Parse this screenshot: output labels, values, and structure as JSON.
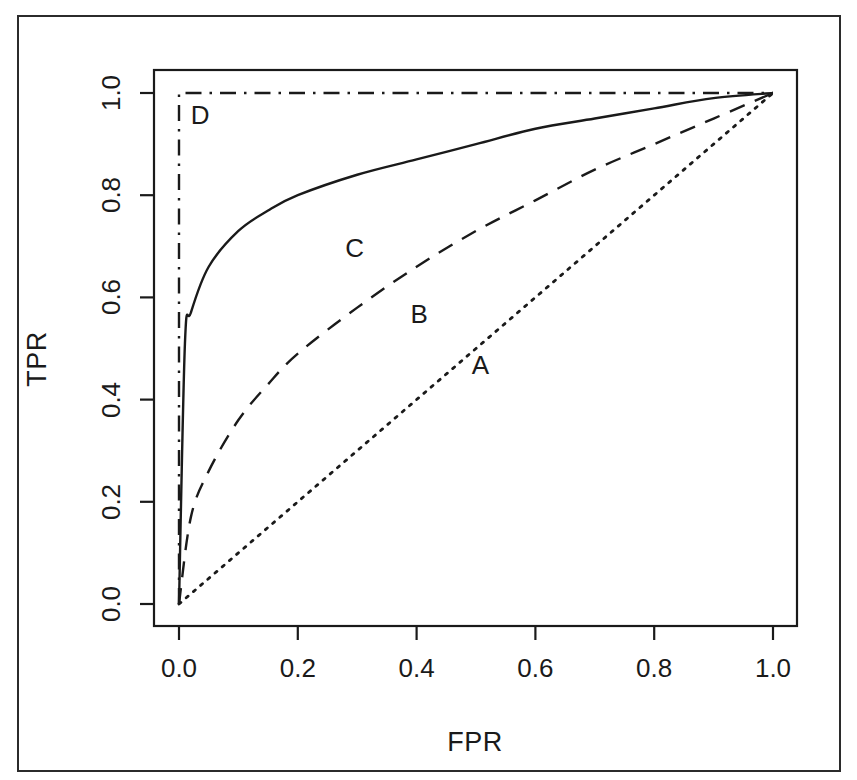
{
  "figure": {
    "plot_area": {
      "x0": 179,
      "x1": 773,
      "y0": 604,
      "y1": 93
    },
    "box": {
      "left": 154,
      "top": 70,
      "right": 797,
      "bottom": 626
    },
    "ink_color": "#1a1a1a"
  },
  "chart_data": {
    "type": "line",
    "title": "",
    "subtitle": "",
    "xlabel": "FPR",
    "ylabel": "TPR",
    "xlim": [
      0,
      1
    ],
    "ylim": [
      0,
      1
    ],
    "xticks": [
      0.0,
      0.2,
      0.4,
      0.6,
      0.8,
      1.0
    ],
    "yticks": [
      0.0,
      0.2,
      0.4,
      0.6,
      0.8,
      1.0
    ],
    "xticklabels": [
      "0.0",
      "0.2",
      "0.4",
      "0.6",
      "0.8",
      "1.0"
    ],
    "yticklabels": [
      "0.0",
      "0.2",
      "0.4",
      "0.6",
      "0.8",
      "1.0"
    ],
    "grid": false,
    "legend": "inline annotations on curves",
    "annotations": [
      {
        "text": "D",
        "x": 0.035,
        "y": 0.955
      },
      {
        "text": "C",
        "x": 0.295,
        "y": 0.695
      },
      {
        "text": "B",
        "x": 0.405,
        "y": 0.565
      },
      {
        "text": "A",
        "x": 0.508,
        "y": 0.465
      }
    ],
    "series": [
      {
        "name": "A",
        "label": "A",
        "linestyle": "dotted",
        "color": "#1a1a1a",
        "description": "random classifier, diagonal chance line",
        "x": [
          0.0,
          0.1,
          0.2,
          0.3,
          0.4,
          0.5,
          0.6,
          0.7,
          0.8,
          0.9,
          1.0
        ],
        "y": [
          0.0,
          0.1,
          0.2,
          0.3,
          0.4,
          0.5,
          0.6,
          0.7,
          0.8,
          0.9,
          1.0
        ]
      },
      {
        "name": "B",
        "label": "B",
        "linestyle": "dashed",
        "color": "#1a1a1a",
        "description": "moderate classifier",
        "x": [
          0.0,
          0.02,
          0.05,
          0.1,
          0.15,
          0.2,
          0.3,
          0.4,
          0.5,
          0.6,
          0.7,
          0.8,
          0.9,
          1.0
        ],
        "y": [
          0.0,
          0.17,
          0.26,
          0.36,
          0.43,
          0.49,
          0.58,
          0.66,
          0.73,
          0.79,
          0.85,
          0.9,
          0.95,
          1.0
        ]
      },
      {
        "name": "C",
        "label": "C",
        "linestyle": "solid",
        "color": "#1a1a1a",
        "description": "strong classifier",
        "x": [
          0.0,
          0.01,
          0.02,
          0.05,
          0.1,
          0.15,
          0.2,
          0.3,
          0.4,
          0.5,
          0.6,
          0.7,
          0.8,
          0.9,
          1.0
        ],
        "y": [
          0.0,
          0.51,
          0.57,
          0.66,
          0.73,
          0.77,
          0.8,
          0.84,
          0.87,
          0.9,
          0.93,
          0.95,
          0.97,
          0.99,
          1.0
        ]
      },
      {
        "name": "D",
        "label": "D",
        "linestyle": "dashdot",
        "color": "#1a1a1a",
        "description": "perfect classifier",
        "x": [
          0.0,
          0.0,
          1.0
        ],
        "y": [
          0.0,
          1.0,
          1.0
        ]
      }
    ]
  }
}
